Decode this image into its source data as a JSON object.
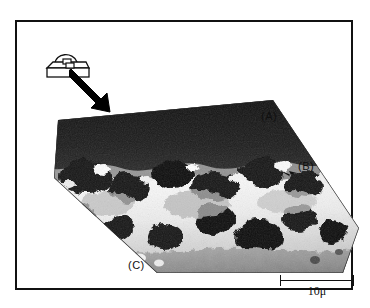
{
  "figure": {
    "domain_kind": "sem-micrograph",
    "border_color": "#111111",
    "background_color": "#ffffff"
  },
  "inset": {
    "name": "specimen-schematic",
    "description": "line drawing of a sample block with a domed cap and small square region",
    "arrow": {
      "name": "pointer-arrow",
      "direction": "down-right",
      "color": "#000000"
    }
  },
  "micrograph": {
    "name": "sem-micrograph-image",
    "shape": "cut-corner-parallelogram",
    "tone_dark": "#1b1b1b",
    "tone_mid": "#7d7d7d",
    "tone_light": "#f2f2f2"
  },
  "labels": [
    {
      "id": "a",
      "text": "(A)"
    },
    {
      "id": "b",
      "text": "(B)"
    },
    {
      "id": "c",
      "text": "(C)"
    }
  ],
  "scale_bar": {
    "label": "10μ",
    "value": 10,
    "unit": "μ",
    "tick_style": "end-ticks"
  }
}
